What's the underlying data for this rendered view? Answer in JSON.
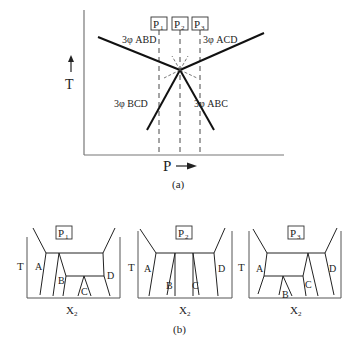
{
  "figure_a": {
    "caption": "(a)",
    "y_axis_label": "T",
    "x_axis_label": "P",
    "pressure_markers": [
      "P",
      "P",
      "P"
    ],
    "pressure_subscripts": [
      "1",
      "2",
      "3"
    ],
    "curves": [
      {
        "label": "3φ ABD"
      },
      {
        "label": "3φ ACD"
      },
      {
        "label": "3φ BCD"
      },
      {
        "label": "3φ ABC"
      }
    ]
  },
  "figure_b": {
    "caption": "(b)",
    "panels": [
      {
        "title": "P",
        "sub": "1",
        "y_label": "T",
        "x_label": "X",
        "x_sub": "2",
        "phases": [
          "A",
          "B",
          "C",
          "D"
        ]
      },
      {
        "title": "P",
        "sub": "2",
        "y_label": "T",
        "x_label": "X",
        "x_sub": "2",
        "phases": [
          "A",
          "B",
          "C",
          "D"
        ]
      },
      {
        "title": "P",
        "sub": "3",
        "y_label": "T",
        "x_label": "X",
        "x_sub": "2",
        "phases": [
          "A",
          "B",
          "C",
          "D"
        ]
      }
    ]
  },
  "colors": {
    "ink": "#222222",
    "axis": "#666666"
  }
}
